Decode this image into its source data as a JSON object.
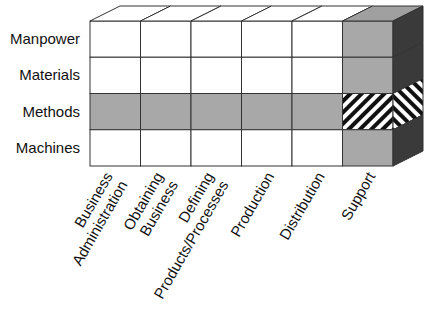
{
  "diagram": {
    "type": "3d-matrix-cube",
    "rows": [
      {
        "label": "Manpower",
        "highlighted": false
      },
      {
        "label": "Materials",
        "highlighted": false
      },
      {
        "label": "Methods",
        "highlighted": true
      },
      {
        "label": "Machines",
        "highlighted": false
      }
    ],
    "columns": [
      {
        "label_lines": [
          "Business",
          "Administration"
        ],
        "highlighted": false
      },
      {
        "label_lines": [
          "Obtaining",
          "Business"
        ],
        "highlighted": false
      },
      {
        "label_lines": [
          "Defining",
          "Products/Processes"
        ],
        "highlighted": false
      },
      {
        "label_lines": [
          "Production"
        ],
        "highlighted": false
      },
      {
        "label_lines": [
          "Distribution"
        ],
        "highlighted": false
      },
      {
        "label_lines": [
          "Support"
        ],
        "highlighted": true
      }
    ],
    "intersection": {
      "row": "Methods",
      "column": "Support",
      "fill": "hatched"
    },
    "colors": {
      "cell": "#ffffff",
      "highlight_front": "#a8a8a8",
      "side_dark": "#3a3a3a",
      "top_highlight": "#a0a0a0",
      "hatch_stripe": "#111111",
      "line": "#333333"
    }
  }
}
